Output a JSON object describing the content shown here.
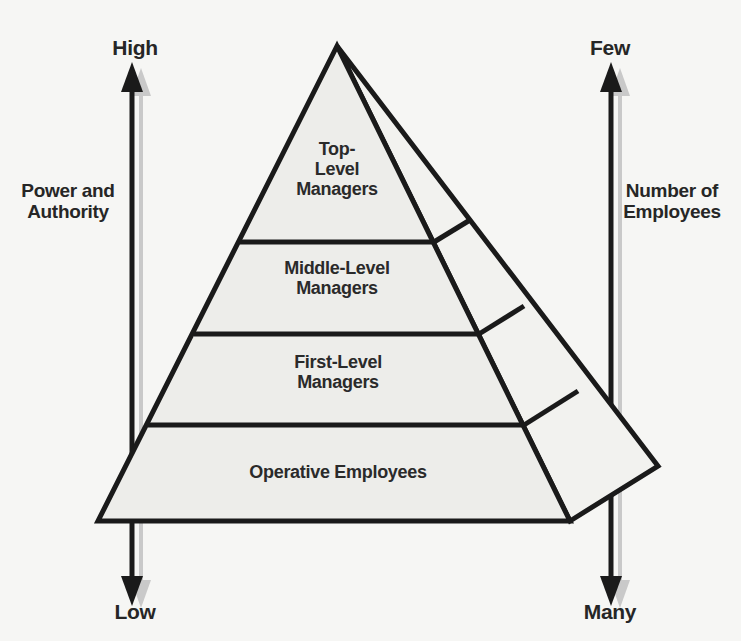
{
  "diagram": {
    "kind": "organizational-pyramid",
    "background_color": "#f6f6f4",
    "line_color": "#1a1a1a",
    "face_front_color": "#ededea",
    "face_side_color": "#f2f2ef",
    "shadow_color": "#c9c9c9",
    "text_color": "#2a2a2a"
  },
  "left_axis": {
    "title": "Power and\nAuthority",
    "top_label": "High",
    "bottom_label": "Low",
    "direction": "bidirectional-vertical"
  },
  "right_axis": {
    "title": "Number of\nEmployees",
    "top_label": "Few",
    "bottom_label": "Many",
    "direction": "bidirectional-vertical"
  },
  "pyramid": {
    "tiers": [
      {
        "id": "top-level",
        "label": "Top-\nLevel\nManagers",
        "rank": 1
      },
      {
        "id": "middle-level",
        "label": "Middle-Level\nManagers",
        "rank": 2
      },
      {
        "id": "first-level",
        "label": "First-Level\nManagers",
        "rank": 3
      },
      {
        "id": "operative",
        "label": "Operative Employees",
        "rank": 4
      }
    ]
  }
}
